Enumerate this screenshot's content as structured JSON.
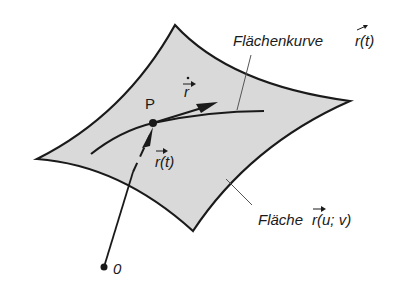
{
  "diagram": {
    "colors": {
      "surface_fill": "#d9d9d9",
      "stroke": "#1a1a1a",
      "leader": "#555555",
      "background": "#ffffff"
    },
    "labels": {
      "curve_label": "Flächenkurve",
      "curve_vec": "r(t)",
      "surface_label": "Fläche",
      "surface_vec": "r(u; v)",
      "point_p": "P",
      "position_vec": "r(t)",
      "tangent_vec": "r",
      "origin": "0"
    }
  }
}
